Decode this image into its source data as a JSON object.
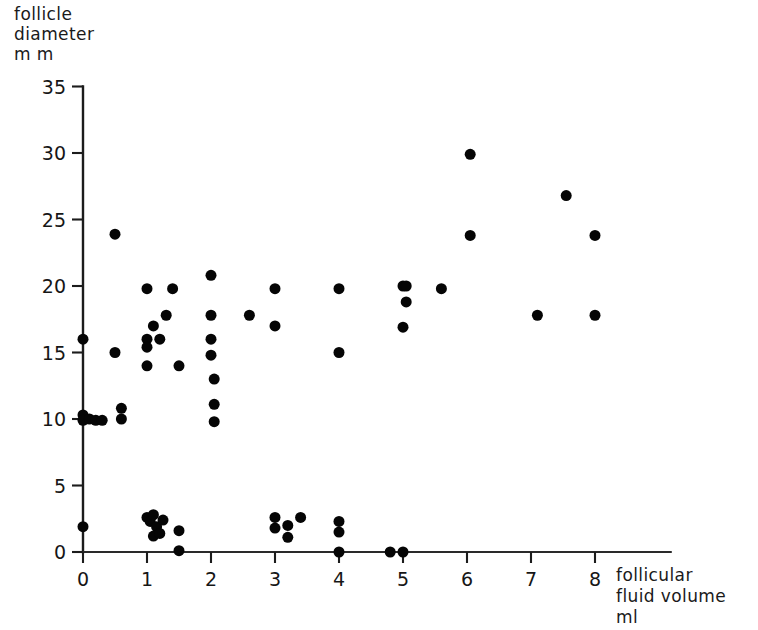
{
  "figure": {
    "y_axis_title": "follicle\ndiameter\nm m",
    "x_axis_title": "follicular\nfluid volume\nml"
  },
  "chart_data": {
    "type": "scatter",
    "title": "",
    "xlabel": "follicular fluid volume ml",
    "ylabel": "follicle diameter mm",
    "xlim": [
      0,
      9.2
    ],
    "ylim": [
      0,
      35
    ],
    "xticks": [
      0,
      1,
      2,
      3,
      4,
      5,
      6,
      7,
      8
    ],
    "yticks": [
      0,
      5,
      10,
      15,
      20,
      25,
      30,
      35
    ],
    "xtick_labels": [
      "0",
      "1",
      "2",
      "3",
      "4",
      "5",
      "6",
      "7",
      "8"
    ],
    "ytick_labels": [
      "0",
      "5",
      "10",
      "15",
      "20",
      "25",
      "30",
      "35"
    ],
    "grid": false,
    "legend": false,
    "marker": "filled-circle",
    "marker_color": "#050505",
    "marker_size_px": 11,
    "points": [
      [
        0.0,
        16.0
      ],
      [
        0.0,
        10.3
      ],
      [
        0.0,
        9.9
      ],
      [
        0.1,
        10.0
      ],
      [
        0.2,
        9.9
      ],
      [
        0.3,
        9.9
      ],
      [
        0.0,
        1.9
      ],
      [
        0.5,
        23.9
      ],
      [
        0.5,
        15.0
      ],
      [
        0.6,
        10.8
      ],
      [
        0.6,
        10.0
      ],
      [
        1.0,
        19.8
      ],
      [
        1.0,
        16.0
      ],
      [
        1.0,
        15.4
      ],
      [
        1.0,
        14.0
      ],
      [
        1.1,
        17.0
      ],
      [
        1.2,
        16.0
      ],
      [
        1.3,
        17.8
      ],
      [
        1.4,
        19.8
      ],
      [
        1.5,
        14.0
      ],
      [
        1.0,
        2.6
      ],
      [
        1.05,
        2.3
      ],
      [
        1.1,
        2.8
      ],
      [
        1.15,
        1.9
      ],
      [
        1.1,
        1.2
      ],
      [
        1.2,
        1.4
      ],
      [
        1.25,
        2.4
      ],
      [
        1.5,
        1.6
      ],
      [
        1.5,
        0.1
      ],
      [
        2.0,
        20.8
      ],
      [
        2.0,
        17.8
      ],
      [
        2.0,
        16.0
      ],
      [
        2.0,
        14.8
      ],
      [
        2.05,
        13.0
      ],
      [
        2.05,
        11.1
      ],
      [
        2.05,
        9.8
      ],
      [
        2.6,
        17.8
      ],
      [
        3.0,
        19.8
      ],
      [
        3.0,
        17.0
      ],
      [
        3.0,
        2.6
      ],
      [
        3.0,
        1.8
      ],
      [
        3.2,
        2.0
      ],
      [
        3.2,
        1.1
      ],
      [
        3.4,
        2.6
      ],
      [
        4.0,
        19.8
      ],
      [
        4.0,
        15.0
      ],
      [
        4.0,
        2.3
      ],
      [
        4.0,
        1.5
      ],
      [
        4.0,
        0.0
      ],
      [
        4.8,
        0.0
      ],
      [
        5.0,
        20.0
      ],
      [
        5.0,
        16.9
      ],
      [
        5.05,
        20.0
      ],
      [
        5.05,
        18.8
      ],
      [
        5.0,
        0.0
      ],
      [
        5.6,
        19.8
      ],
      [
        6.05,
        29.9
      ],
      [
        6.05,
        23.8
      ],
      [
        7.1,
        17.8
      ],
      [
        7.55,
        26.8
      ],
      [
        8.0,
        23.8
      ],
      [
        8.0,
        17.8
      ]
    ]
  }
}
